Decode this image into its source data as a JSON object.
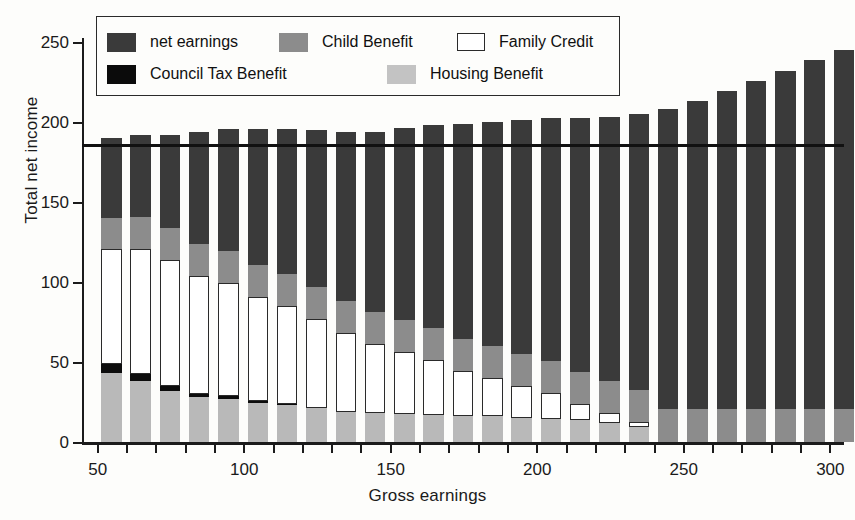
{
  "chart_data": {
    "type": "bar",
    "stacked": true,
    "title": "",
    "xlabel": "Gross earnings",
    "ylabel": "Total net income",
    "xlim": [
      45,
      305
    ],
    "ylim": [
      0,
      250
    ],
    "yticks": [
      0,
      50,
      100,
      150,
      200,
      250
    ],
    "xticks": [
      50,
      60,
      70,
      80,
      90,
      100,
      110,
      120,
      130,
      140,
      150,
      160,
      170,
      180,
      190,
      200,
      210,
      220,
      230,
      240,
      250,
      260,
      270,
      280,
      290,
      300
    ],
    "xticklabels_shown": [
      50,
      100,
      150,
      200,
      250,
      300
    ],
    "grid": false,
    "legend_position": "upper-left-inside",
    "categories": [
      50,
      60,
      70,
      80,
      90,
      100,
      110,
      120,
      130,
      140,
      150,
      160,
      170,
      180,
      190,
      200,
      210,
      220,
      230,
      240,
      250,
      260,
      270,
      280,
      290,
      300
    ],
    "series": [
      {
        "name": "Housing Benefit",
        "color": "#b9b9b9",
        "values": [
          43.0,
          38.0,
          32.0,
          28.0,
          27.0,
          24.5,
          23.0,
          21.0,
          19.0,
          18.0,
          17.5,
          17.0,
          16.5,
          16.0,
          15.0,
          14.5,
          13.5,
          12.0,
          9.5,
          0.0,
          0.0,
          0.0,
          0.0,
          0.0,
          0.0,
          0.0
        ]
      },
      {
        "name": "Council Tax Benefit",
        "color": "#0d0d0d",
        "values": [
          5.5,
          4.5,
          3.0,
          1.8,
          1.6,
          1.2,
          1.0,
          0.0,
          0.0,
          0.0,
          0.0,
          0.0,
          0.0,
          0.0,
          0.0,
          0.0,
          0.0,
          0.0,
          0.0,
          0.0,
          0.0,
          0.0,
          0.0,
          0.0,
          0.0,
          0.0
        ]
      },
      {
        "name": "Family Credit",
        "color": "#ffffff",
        "values": [
          72.0,
          78.0,
          79.0,
          74.0,
          71.0,
          65.0,
          61.0,
          56.0,
          49.0,
          43.0,
          39.0,
          34.0,
          28.0,
          24.0,
          20.0,
          16.0,
          10.0,
          6.0,
          3.0,
          0.0,
          0.0,
          0.0,
          0.0,
          0.0,
          0.0,
          0.0
        ]
      },
      {
        "name": "Child Benefit",
        "color": "#8c8c8c",
        "values": [
          19.5,
          20.0,
          20.0,
          20.0,
          20.0,
          20.0,
          20.0,
          20.0,
          20.0,
          20.0,
          20.0,
          20.0,
          20.0,
          20.0,
          20.0,
          20.0,
          20.0,
          20.0,
          20.0,
          20.5,
          20.5,
          20.5,
          20.5,
          20.5,
          20.5,
          20.5
        ]
      },
      {
        "name": "net earnings",
        "color": "#3a3a3a",
        "values": [
          50.0,
          51.5,
          58.0,
          70.0,
          76.0,
          85.0,
          90.5,
          98.0,
          105.5,
          113.0,
          119.5,
          127.0,
          134.0,
          140.0,
          146.5,
          152.0,
          159.0,
          165.0,
          172.5,
          187.5,
          192.5,
          199.0,
          205.0,
          211.5,
          218.0,
          224.5
        ]
      }
    ],
    "totals": [
      190.0,
      192.0,
      192.0,
      193.8,
      195.6,
      194.7,
      195.5,
      195.0,
      193.5,
      194.0,
      196.0,
      198.0,
      198.5,
      200.0,
      201.5,
      202.5,
      202.5,
      203.0,
      205.0,
      208.0,
      213.0,
      219.5,
      225.5,
      232.0,
      238.5,
      245.0
    ],
    "reference_line": {
      "orientation": "horizontal",
      "value": 186.0,
      "color": "#111111",
      "label": ""
    }
  },
  "legend": {
    "items": [
      {
        "label": "net earnings",
        "swatch": "swatch-net-earnings"
      },
      {
        "label": "Child Benefit",
        "swatch": "swatch-child-benefit"
      },
      {
        "label": "Family Credit",
        "swatch": "swatch-family-credit"
      },
      {
        "label": "Council Tax Benefit",
        "swatch": "swatch-council-tax-benefit"
      },
      {
        "label": "Housing Benefit",
        "swatch": "swatch-housing-benefit"
      }
    ]
  },
  "axes": {
    "ylabel": "Total net income",
    "xlabel": "Gross earnings",
    "ytick_labels": [
      "0",
      "50",
      "100",
      "150",
      "200",
      "250"
    ],
    "xtick_labels": [
      "50",
      "100",
      "150",
      "200",
      "250",
      "300"
    ]
  }
}
